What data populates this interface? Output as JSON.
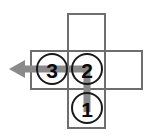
{
  "diagram": {
    "background_color": "#ffffff",
    "canvas": {
      "width": 152,
      "height": 140
    },
    "grid": {
      "cell_size": 37,
      "border_color": "#6e6e6e",
      "border_width": 2,
      "cells": [
        {
          "name": "cell-top",
          "label": "",
          "x": 68,
          "y": 14,
          "w": 37,
          "h": 37
        },
        {
          "name": "cell-middle-left",
          "label": "",
          "x": 31,
          "y": 51,
          "w": 37,
          "h": 38
        },
        {
          "name": "cell-middle-center",
          "label": "",
          "x": 68,
          "y": 51,
          "w": 37,
          "h": 38
        },
        {
          "name": "cell-middle-right",
          "label": "",
          "x": 105,
          "y": 51,
          "w": 37,
          "h": 38
        },
        {
          "name": "cell-bottom",
          "label": "",
          "x": 68,
          "y": 89,
          "w": 37,
          "h": 39
        }
      ]
    },
    "path": {
      "color": "#8a8a8a",
      "width": 7,
      "direction": "left",
      "description": "Path runs from node 1 upward to node 2, then left through node 3 and exits left with an arrowhead",
      "points": "87,112 87,69 22,69",
      "arrow": {
        "tip_x": 9,
        "tip_y": 69,
        "back_x": 24,
        "half_height": 9
      }
    },
    "nodes": [
      {
        "name": "node-1",
        "label": "1",
        "cx": 87,
        "cy": 108,
        "r": 15
      },
      {
        "name": "node-2",
        "label": "2",
        "cx": 87,
        "cy": 69,
        "r": 15
      },
      {
        "name": "node-3",
        "label": "3",
        "cx": 52,
        "cy": 69,
        "r": 15
      }
    ],
    "node_style": {
      "circle_stroke": "#1a1a1a",
      "circle_stroke_width": 2,
      "label_color": "#0b0b0b"
    }
  }
}
